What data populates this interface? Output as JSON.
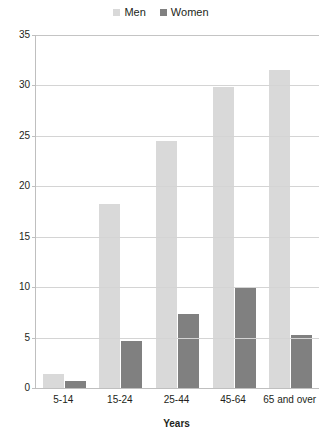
{
  "chart_data": {
    "type": "bar",
    "title": "",
    "subtitle": "",
    "xlabel": "Years",
    "ylabel": "",
    "categories": [
      "5-14",
      "15-24",
      "25-44",
      "45-64",
      "65 and over"
    ],
    "series": [
      {
        "name": "Men",
        "color": "#d9d9d9",
        "values": [
          1.4,
          18.2,
          24.5,
          29.8,
          31.5
        ]
      },
      {
        "name": "Women",
        "color": "#808080",
        "values": [
          0.7,
          4.7,
          7.3,
          10.0,
          5.3
        ]
      }
    ],
    "ylim": [
      0,
      35
    ],
    "ytick_step": 5,
    "yticks": [
      0,
      5,
      10,
      15,
      20,
      25,
      30,
      35
    ],
    "ytick_labels": [
      "0",
      "5",
      "10",
      "15",
      "20",
      "25",
      "30",
      "35"
    ],
    "grid": true,
    "grid_axis": "y",
    "legend_position": "top-center",
    "bar_mode": "grouped",
    "background": "#ffffff",
    "axis_color": "#bfbfbf",
    "grid_color": "#d4d4d4",
    "text_color": "#231f20"
  },
  "legend": {
    "items": [
      {
        "label": "Men",
        "swatch_color": "#d9d9d9",
        "icon": "legend-swatch-icon"
      },
      {
        "label": "Women",
        "swatch_color": "#808080",
        "icon": "legend-swatch-icon"
      }
    ]
  },
  "axes": {
    "x_title": "Years"
  }
}
